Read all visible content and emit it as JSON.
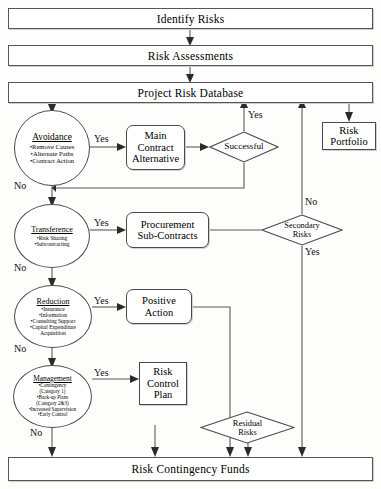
{
  "diagram": {
    "stages": {
      "identify": "Identify Risks",
      "assessments": "Risk Assessments",
      "database": "Project Risk Database",
      "contingency": "Risk Contingency Funds"
    },
    "strategies": [
      {
        "id": "avoidance",
        "heading": "Avoidance",
        "bullets": [
          "•Remove Causes",
          "•Alternate Paths",
          "•Contract Action"
        ],
        "yes_label": "Yes",
        "no_label": "No"
      },
      {
        "id": "transference",
        "heading": "Transference",
        "bullets": [
          "•Risk Sharing",
          "•Subcontracting"
        ],
        "yes_label": "Yes",
        "no_label": "No"
      },
      {
        "id": "reduction",
        "heading": "Reduction",
        "bullets": [
          "•Insurance",
          "•Information",
          "•Consulting Support",
          "•Capital Expenditure",
          "Acquisition"
        ],
        "yes_label": "Yes",
        "no_label": "No"
      },
      {
        "id": "management",
        "heading": "Management",
        "bullets": [
          "•Contingency",
          "(Category 1)",
          "•Back-up Plans",
          "(Category 2&3)",
          "•Increased Supervision",
          "•Early Control"
        ],
        "yes_label": "Yes",
        "no_label": "No"
      }
    ],
    "actions": {
      "main_contract_alternative": "Main\nContract\nAlternative",
      "main_contract_alternative_lines": [
        "Main",
        "Contract",
        "Alternative"
      ],
      "procurement_lines": [
        "Procurement",
        "Sub-Contracts"
      ],
      "positive_action_lines": [
        "Positive",
        "Action"
      ],
      "risk_control_plan_lines": [
        "Risk",
        "Control",
        "Plan"
      ],
      "risk_portfolio_lines": [
        "Risk",
        "Portfolio"
      ]
    },
    "decisions": [
      {
        "id": "successful",
        "lines": [
          "Successful"
        ],
        "yes_label": "Yes"
      },
      {
        "id": "secondary-risks",
        "lines": [
          "Secondary",
          "Risks"
        ],
        "no_label": "No",
        "yes_label": "Yes"
      },
      {
        "id": "residual-risks",
        "lines": [
          "Residual",
          "Risks"
        ]
      }
    ],
    "colors": {
      "stroke": "#5a5a5a",
      "node_border": "#4a4a4a",
      "text": "#000000",
      "background": "#fdfdfb",
      "arrowhead": "#2b2b2b"
    }
  }
}
